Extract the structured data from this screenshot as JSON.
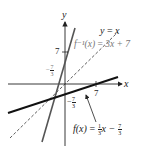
{
  "diagram": {
    "axes": {
      "x_label": "x",
      "y_label": "y"
    },
    "ticks": {
      "y_pos_7": "7",
      "y_neg_frac": {
        "sign": "−",
        "num": "7",
        "den": "3"
      },
      "x_pos_7": "7",
      "x_neg_frac": {
        "sign": "−",
        "num": "7",
        "den": "3"
      }
    },
    "labels": {
      "identity": {
        "lhs": "y",
        "eq": "=",
        "rhs": "x"
      },
      "inverse": {
        "lhs": "f⁻¹(x)",
        "eq": "=",
        "rhs": "3x + 7"
      },
      "function": {
        "lhs": "f(x)",
        "eq": "=",
        "frac_num": "1",
        "frac_den": "3",
        "mid": "x −",
        "frac2_num": "7",
        "frac2_den": "3"
      }
    },
    "colors": {
      "axis": "#222222",
      "steep_line": "#555555",
      "shallow_line": "#111111",
      "identity_line": "#333333"
    }
  }
}
